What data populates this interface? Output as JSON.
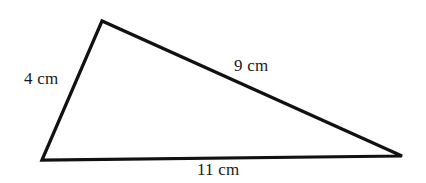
{
  "figure": {
    "type": "triangle",
    "background_color": "#ffffff",
    "stroke_color": "#111111",
    "stroke_width": 3.2,
    "vertices": [
      {
        "name": "bottom-left",
        "x": 42,
        "y": 160
      },
      {
        "name": "apex",
        "x": 102,
        "y": 21
      },
      {
        "name": "bottom-right",
        "x": 402,
        "y": 156
      }
    ],
    "labels": {
      "left_side": "4 cm",
      "top_right_side": "9 cm",
      "bottom_side": "11 cm"
    }
  }
}
